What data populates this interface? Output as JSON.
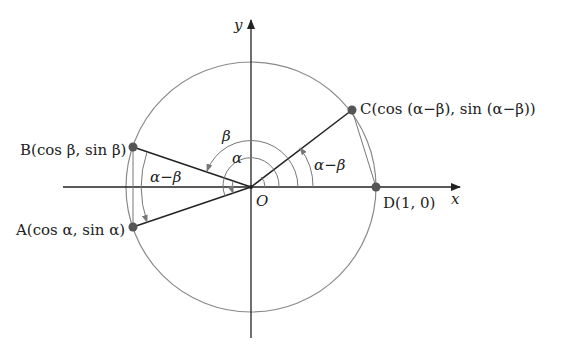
{
  "figure": {
    "axes": {
      "x_label": "x",
      "y_label": "y",
      "origin_label": "O"
    },
    "points": {
      "A": {
        "label": "A(cos α, sin α)"
      },
      "B": {
        "label": "B(cos β, sin β)"
      },
      "C": {
        "label": "C(cos (α−β), sin (α−β))"
      },
      "D": {
        "label": "D(1, 0)"
      }
    },
    "angles": {
      "beta": "β",
      "alpha": "α",
      "alpha_minus_beta_left": "α−β",
      "alpha_minus_beta_right": "α−β"
    },
    "colors": {
      "axis": "#222222",
      "circle": "#8a8a8a",
      "point": "#555555",
      "ray": "#222222",
      "arc": "#777777"
    }
  }
}
